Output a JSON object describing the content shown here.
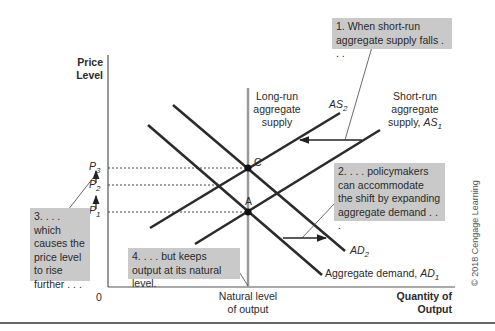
{
  "axes": {
    "y_label_line1": "Price",
    "y_label_line2": "Level",
    "x_label_line1": "Quantity of",
    "x_label_line2": "Output",
    "origin": "0",
    "natural_level_line1": "Natural level",
    "natural_level_line2": "of output"
  },
  "curves": {
    "lras_line1": "Long-run",
    "lras_line2": "aggregate",
    "lras_line3": "supply",
    "sras_line1": "Short-run",
    "sras_line2": "aggregate",
    "sras_line3": "supply, ",
    "as1_sym": "AS",
    "as1_sub": "1",
    "as2_sym": "AS",
    "as2_sub": "2",
    "ad1_text": "Aggregate demand, ",
    "ad1_sym": "AD",
    "ad1_sub": "1",
    "ad2_sym": "AD",
    "ad2_sub": "2"
  },
  "points": {
    "a": "A",
    "c": "C"
  },
  "price_levels": {
    "p_sym": "P",
    "p1_sub": "1",
    "p2_sub": "2",
    "p3_sub": "3"
  },
  "callouts": {
    "step1": "1. When short-run aggregate supply falls . . .",
    "step2": "2. . . . policymakers can accommodate the shift by expanding aggregate demand . . .",
    "step3": "3. . . . which causes the price level to rise further . . .",
    "step4": "4. . . . but keeps output at its natural level."
  },
  "copyright": "© 2018 Cengage Learning",
  "colors": {
    "curve": "#2b2b2b",
    "lras": "#9a9a9a",
    "callout_bg": "#c9c9c9",
    "axis": "#555555"
  }
}
